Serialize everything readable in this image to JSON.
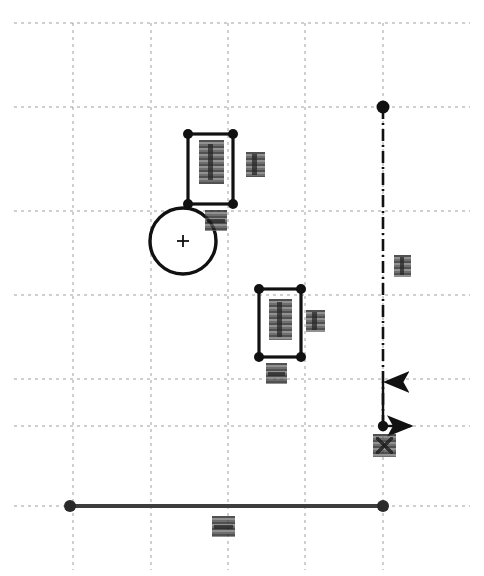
{
  "diagram": {
    "title": "Engineering sketch — plan view with centerline and origin datum",
    "type": "cad-sketch",
    "canvas": {
      "width": 484,
      "height": 576,
      "background": "#ffffff"
    },
    "colors": {
      "geometry": "#111111",
      "grid": "#9a9a9a",
      "centerline": "#111111",
      "label": "#3a3a3a"
    },
    "grid": {
      "style": "dashed",
      "color": "#9a9a9a",
      "vertical_lines_x": [
        73,
        151,
        228,
        305,
        383
      ],
      "horizontal_lines_y": [
        23,
        107,
        211,
        295,
        379,
        426,
        506
      ],
      "spacing_x": 77,
      "spacing_y": 84
    },
    "shapes": [
      {
        "name": "rectangle-upper",
        "kind": "rectangle",
        "x": 188,
        "y": 134,
        "width": 45,
        "height": 70,
        "corner_nodes": 4
      },
      {
        "name": "rectangle-lower",
        "kind": "rectangle",
        "x": 259,
        "y": 289,
        "width": 42,
        "height": 68,
        "corner_nodes": 4
      },
      {
        "name": "circle-datum",
        "kind": "circle",
        "cx": 183,
        "cy": 241,
        "r": 33,
        "center_mark": "+"
      },
      {
        "name": "baseline-horizontal",
        "kind": "line",
        "x1": 70,
        "y1": 506,
        "x2": 383,
        "y2": 506,
        "endpoint_nodes": 2
      },
      {
        "name": "centerline-vertical",
        "kind": "centerline",
        "x1": 383,
        "y1": 107,
        "x2": 383,
        "y2": 426,
        "style": "dash-dot",
        "top_node": true
      }
    ],
    "origin": {
      "name": "origin-datum",
      "x": 383,
      "y": 426,
      "x_axis_arrow_length": 28,
      "y_axis_arrow_length": 44
    },
    "labels": [
      {
        "name": "label-rectangle-upper-dim",
        "x": 199,
        "y": 140,
        "width": 25,
        "height": 44,
        "redacted": true,
        "variant": "tall"
      },
      {
        "name": "label-rectangle-upper-side",
        "x": 246,
        "y": 152,
        "width": 19,
        "height": 25,
        "redacted": true,
        "variant": "tall"
      },
      {
        "name": "label-circle-datum",
        "x": 205,
        "y": 210,
        "width": 22,
        "height": 21,
        "redacted": true,
        "variant": "wide"
      },
      {
        "name": "label-rectangle-lower-dim",
        "x": 269,
        "y": 299,
        "width": 23,
        "height": 41,
        "redacted": true,
        "variant": "tall"
      },
      {
        "name": "label-rectangle-lower-side",
        "x": 306,
        "y": 310,
        "width": 19,
        "height": 22,
        "redacted": true,
        "variant": "tall"
      },
      {
        "name": "label-rectangle-lower-below",
        "x": 266,
        "y": 363,
        "width": 21,
        "height": 21,
        "redacted": true,
        "variant": "wide"
      },
      {
        "name": "label-centerline-right",
        "x": 394,
        "y": 255,
        "width": 17,
        "height": 22,
        "redacted": true,
        "variant": "tall"
      },
      {
        "name": "label-origin-datum",
        "x": 373,
        "y": 434,
        "width": 23,
        "height": 23,
        "redacted": true,
        "variant": "cross"
      },
      {
        "name": "label-baseline-dim",
        "x": 212,
        "y": 516,
        "width": 23,
        "height": 21,
        "redacted": true,
        "variant": "wide"
      }
    ]
  }
}
